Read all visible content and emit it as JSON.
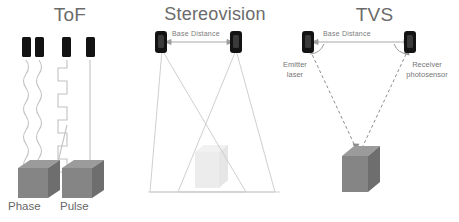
{
  "figure": {
    "type": "diagram",
    "background_color": "#ffffff",
    "panels": [
      {
        "id": "tof",
        "title": "ToF",
        "variants": [
          {
            "id": "phase",
            "caption": "Phase",
            "signal": "sine-wave",
            "emitters": 2
          },
          {
            "id": "pulse",
            "caption": "Pulse",
            "signal": "square-wave",
            "emitters": 2
          }
        ],
        "target_shape": "cube",
        "target_color": "#808080"
      },
      {
        "id": "stereovision",
        "title": "Stereovision",
        "base_label": "Base Distance",
        "cameras": 2,
        "field_of_view": "two overlapping triangular cones",
        "target_shape": "cube",
        "target_color": "#e8e8e8"
      },
      {
        "id": "tvs",
        "title": "TVS",
        "base_label": "Base Distance",
        "left_label_line1": "Emitter",
        "left_label_line2": "laser",
        "right_label_line1": "Receiver",
        "right_label_line2": "photosensor",
        "ray_style": "dashed",
        "angle_arcs": 2,
        "target_shape": "cube",
        "target_color": "#808080"
      }
    ],
    "colors": {
      "title_gray": "#6b6b6b",
      "caption_gray": "#676767",
      "sensor_black": "#131313",
      "cube_gray": "#858585",
      "cube_top_gray": "#9a9a9a",
      "cube_side_gray": "#6e6e6e",
      "faint_cube": "#e8e8e8",
      "line_gray": "#b9b9b9",
      "dashed_gray": "#909090"
    }
  }
}
